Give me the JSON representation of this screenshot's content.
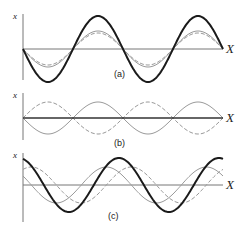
{
  "figure": {
    "panels": [
      {
        "id": "a",
        "caption": "(a)",
        "y_axis_label": "x",
        "x_axis_label": "X",
        "description": "Two in-phase waves add constructively: resultant has larger amplitude",
        "waves": [
          {
            "name": "wave-1",
            "style": "solid-gray",
            "amplitude": 18,
            "phase_deg": 180
          },
          {
            "name": "wave-2",
            "style": "dashed-gray",
            "amplitude": 16,
            "phase_deg": 180
          },
          {
            "name": "resultant",
            "style": "thick-dark",
            "amplitude": 33,
            "phase_deg": 180
          }
        ]
      },
      {
        "id": "b",
        "caption": "(b)",
        "y_axis_label": "x",
        "x_axis_label": "X",
        "description": "Two out-of-phase waves cancel: resultant is flat",
        "waves": [
          {
            "name": "wave-1",
            "style": "solid-gray",
            "amplitude": 16,
            "phase_deg": 180
          },
          {
            "name": "wave-2",
            "style": "dashed-gray",
            "amplitude": 16,
            "phase_deg": 0
          },
          {
            "name": "resultant",
            "style": "thick-dark",
            "amplitude": 0,
            "phase_deg": 0
          }
        ]
      },
      {
        "id": "c",
        "caption": "(c)",
        "y_axis_label": "x",
        "x_axis_label": "X",
        "description": "Two waves with a partial phase difference: resultant with intermediate amplitude and shifted phase",
        "waves": [
          {
            "name": "wave-1",
            "style": "solid-gray",
            "amplitude": 18,
            "phase_deg": 150
          },
          {
            "name": "wave-2",
            "style": "dashed-gray",
            "amplitude": 18,
            "phase_deg": 60
          },
          {
            "name": "resultant",
            "style": "thick-dark",
            "amplitude": 27,
            "phase_deg": 105
          }
        ]
      }
    ]
  }
}
